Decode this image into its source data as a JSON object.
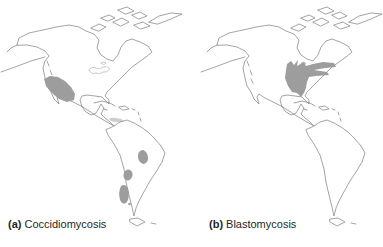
{
  "figure": {
    "background": "#ffffff",
    "panels": [
      {
        "id": "a",
        "prefix": "(a)",
        "title": "Coccidiomycosis",
        "shaded_regions": [
          "southwestern-united-states-and-northern-mexico",
          "venezuela-caribbean-coast",
          "east-central-brazil",
          "paraguay-gran-chaco",
          "northern-argentina"
        ]
      },
      {
        "id": "b",
        "prefix": "(b)",
        "title": "Blastomycosis",
        "shaded_regions": [
          "mississippi-and-ohio-river-valleys",
          "great-lakes-and-st-lawrence-region"
        ]
      }
    ],
    "colors": {
      "shading": "#9d9d9d",
      "coastline": "#7d7d7d",
      "lakes": "#b5b5b5",
      "label_text": "#1f1f1f"
    }
  }
}
